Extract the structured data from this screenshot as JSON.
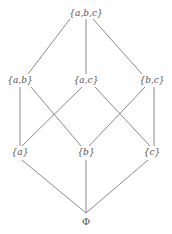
{
  "diagram": {
    "type": "hasse-diagram",
    "nodes": [
      {
        "id": "abc",
        "label": "{a,b,c}",
        "x": 86,
        "y": 13
      },
      {
        "id": "ab",
        "label": "{a,b}",
        "x": 20,
        "y": 80
      },
      {
        "id": "ac",
        "label": "{a,c}",
        "x": 86,
        "y": 80
      },
      {
        "id": "bc",
        "label": "{b,c}",
        "x": 152,
        "y": 80
      },
      {
        "id": "a",
        "label": "{a}",
        "x": 20,
        "y": 152
      },
      {
        "id": "b",
        "label": "{b}",
        "x": 86,
        "y": 152
      },
      {
        "id": "c",
        "label": "{c}",
        "x": 152,
        "y": 152
      },
      {
        "id": "empty",
        "label": "Φ",
        "x": 86,
        "y": 222
      }
    ],
    "edges": [
      {
        "from": "abc",
        "to": "ab"
      },
      {
        "from": "abc",
        "to": "ac"
      },
      {
        "from": "abc",
        "to": "bc"
      },
      {
        "from": "ab",
        "to": "a"
      },
      {
        "from": "ab",
        "to": "b"
      },
      {
        "from": "ac",
        "to": "a"
      },
      {
        "from": "ac",
        "to": "c"
      },
      {
        "from": "bc",
        "to": "b"
      },
      {
        "from": "bc",
        "to": "c"
      },
      {
        "from": "a",
        "to": "empty"
      },
      {
        "from": "b",
        "to": "empty"
      },
      {
        "from": "c",
        "to": "empty"
      }
    ],
    "edge_color": "#8a8a8a",
    "label_color": "#555555"
  }
}
